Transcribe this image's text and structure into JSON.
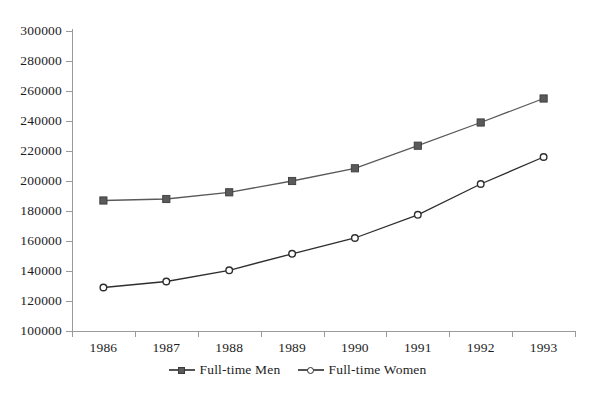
{
  "chart_data": {
    "type": "line",
    "title": "",
    "subtitle": "",
    "xlabel": "",
    "ylabel": "",
    "categories": [
      "1986",
      "1987",
      "1988",
      "1989",
      "1990",
      "1991",
      "1992",
      "1993"
    ],
    "series": [
      {
        "name": "Full-time Men",
        "marker": "square-filled",
        "color": "#5a5a5a",
        "values": [
          187000,
          188000,
          192500,
          200000,
          208500,
          223500,
          239000,
          255000
        ]
      },
      {
        "name": "Full-time Women",
        "marker": "circle-open",
        "color": "#2e2e2e",
        "values": [
          129000,
          133000,
          140500,
          151500,
          162000,
          177500,
          198000,
          216000
        ]
      }
    ],
    "ylim": [
      100000,
      300000
    ],
    "ytick_step": 20000,
    "ytick_labels": [
      "300000",
      "280000",
      "260000",
      "240000",
      "220000",
      "200000",
      "180000",
      "160000",
      "140000",
      "120000",
      "100000"
    ],
    "grid": false,
    "legend_position": "bottom",
    "axis_color": "#9a9a9a"
  },
  "legend": {
    "entries": [
      {
        "label": "Full-time Men"
      },
      {
        "label": "Full-time Women"
      }
    ]
  }
}
